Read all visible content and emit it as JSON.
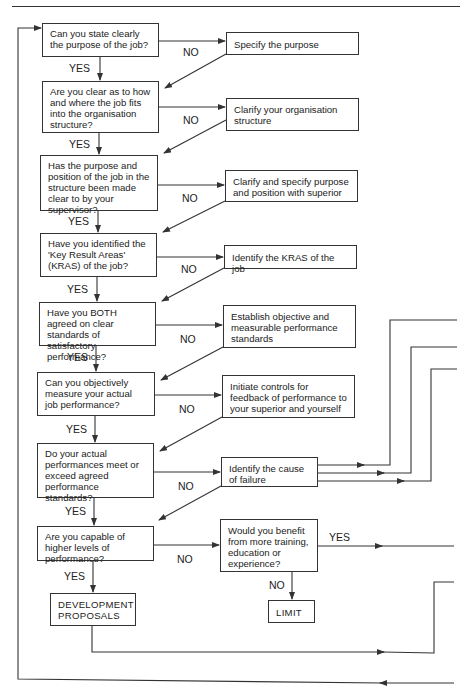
{
  "flowchart": {
    "questions": [
      {
        "id": "q1",
        "text": "Can you state clearly the purpose of the job?",
        "yes": "YES",
        "no": "NO"
      },
      {
        "id": "q2",
        "text": "Are you clear as to how and where the job fits into the organisation structure?",
        "yes": "YES",
        "no": "NO"
      },
      {
        "id": "q3",
        "text": "Has the purpose and position of the job in the structure been made clear to by your supervisor?",
        "yes": "YES",
        "no": "NO"
      },
      {
        "id": "q4",
        "text": "Have you identified the 'Key Result Areas' (KRAS) of the job?",
        "yes": "YES",
        "no": "NO"
      },
      {
        "id": "q5",
        "text": "Have you BOTH agreed on clear standards of satisfactory performance?",
        "yes": "YES",
        "no": "NO"
      },
      {
        "id": "q6",
        "text": "Can you objectively measure your actual job performance?",
        "yes": "YES",
        "no": "NO"
      },
      {
        "id": "q7",
        "text": "Do your actual performances meet or exceed agreed performance standards?",
        "yes": "YES",
        "no": "NO"
      },
      {
        "id": "q8",
        "text": "Are you capable of higher levels of performance?",
        "yes": "YES",
        "no": "NO"
      }
    ],
    "actions": [
      {
        "id": "a1",
        "text": "Specify the purpose"
      },
      {
        "id": "a2",
        "text": "Clarify your organisation structure"
      },
      {
        "id": "a3",
        "text": "Clarify and specify purpose and position with superior"
      },
      {
        "id": "a4",
        "text": "Identify the KRAS of the job"
      },
      {
        "id": "a5",
        "text": "Establish objective and measurable performance standards"
      },
      {
        "id": "a6",
        "text": "Initiate controls for feedback of performance to your superior and yourself"
      },
      {
        "id": "a7",
        "text": "Identify the cause of failure"
      }
    ],
    "training_question": {
      "text": "Would you benefit from more training, education or experience?",
      "yes": "YES",
      "no": "NO"
    },
    "outcomes": {
      "development": "DEVELOPMENT PROPOSALS",
      "limit": "LIMIT"
    }
  }
}
